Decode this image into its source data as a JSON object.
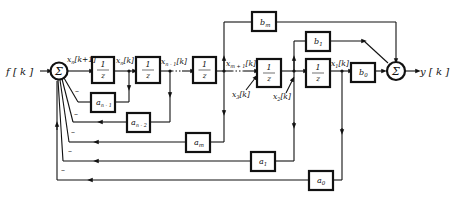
{
  "input_label": "f [ k ]",
  "output_label": "y [ k ]",
  "summers": [
    {
      "id": "input-sum",
      "symbol": "Σ"
    },
    {
      "id": "output-sum",
      "symbol": "Σ"
    }
  ],
  "delay_blocks": [
    {
      "num": "1",
      "den": "z"
    },
    {
      "num": "1",
      "den": "z"
    },
    {
      "num": "1",
      "den": "z"
    },
    {
      "num": "1",
      "den": "z"
    },
    {
      "num": "1",
      "den": "z"
    }
  ],
  "feedback_gains": [
    {
      "base": "a",
      "sub": "n - 1"
    },
    {
      "base": "a",
      "sub": "n - 2"
    },
    {
      "base": "a",
      "sub": "m"
    },
    {
      "base": "a",
      "sub": "1"
    },
    {
      "base": "a",
      "sub": "0"
    }
  ],
  "feedforward_gains": [
    {
      "base": "b",
      "sub": "m"
    },
    {
      "base": "b",
      "sub": "1"
    },
    {
      "base": "b",
      "sub": "0"
    }
  ],
  "signals": {
    "xn_k1": {
      "base": "x",
      "sub": "n",
      "tail": "[k+1]"
    },
    "xn_k": {
      "base": "x",
      "sub": "n",
      "tail": "[k]"
    },
    "xn1_k": {
      "base": "x",
      "sub": "n - 1",
      "tail": "[k]"
    },
    "xm1_k": {
      "base": "x",
      "sub": "m + 1",
      "tail": "[k]"
    },
    "x3_k": {
      "base": "x",
      "sub": "3",
      "tail": "[k]"
    },
    "x2_k": {
      "base": "x",
      "sub": "2",
      "tail": "[k]"
    },
    "x1_k": {
      "base": "x",
      "sub": "1",
      "tail": "[k]"
    }
  },
  "minus_sign": "–"
}
